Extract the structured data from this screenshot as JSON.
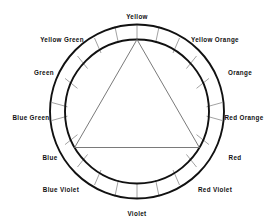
{
  "diagram": {
    "title_visible": false,
    "type": "color-wheel",
    "background_color": "#ffffff",
    "line_color": "#111111",
    "divider_color": "#8a8a8a",
    "triangle_color": "#7a7a7a",
    "geometry": {
      "center_x": 137,
      "center_y": 111.5,
      "outer_radius": 87,
      "inner_radius": 72,
      "segment_count": 12,
      "segment_angle_degrees": 30,
      "divider_offset_degrees": 15
    },
    "segments": [
      {
        "label": "Yellow",
        "angle_degrees": 0,
        "label_x": 137,
        "label_y": 17,
        "align": "center"
      },
      {
        "label": "Yellow Orange",
        "angle_degrees": 30,
        "label_x": 215,
        "label_y": 40,
        "align": "center"
      },
      {
        "label": "Orange",
        "angle_degrees": 60,
        "label_x": 240,
        "label_y": 73,
        "align": "center"
      },
      {
        "label": "Red Orange",
        "angle_degrees": 90,
        "label_x": 244,
        "label_y": 118,
        "align": "center"
      },
      {
        "label": "Red",
        "angle_degrees": 120,
        "label_x": 235,
        "label_y": 158,
        "align": "center"
      },
      {
        "label": "Red Violet",
        "angle_degrees": 150,
        "label_x": 215,
        "label_y": 190,
        "align": "center"
      },
      {
        "label": "Violet",
        "angle_degrees": 180,
        "label_x": 137,
        "label_y": 214,
        "align": "center"
      },
      {
        "label": "Blue Violet",
        "angle_degrees": 210,
        "label_x": 61,
        "label_y": 190,
        "align": "center"
      },
      {
        "label": "Blue",
        "angle_degrees": 240,
        "label_x": 50,
        "label_y": 158,
        "align": "center"
      },
      {
        "label": "Blue Green",
        "angle_degrees": 270,
        "label_x": 31,
        "label_y": 118,
        "align": "center"
      },
      {
        "label": "Green",
        "angle_degrees": 300,
        "label_x": 44,
        "label_y": 73,
        "align": "center"
      },
      {
        "label": "Yellow Green",
        "angle_degrees": 330,
        "label_x": 62,
        "label_y": 40,
        "align": "center"
      }
    ],
    "primary_triangle": {
      "vertices": [
        {
          "label": "Yellow",
          "angle_degrees": 0,
          "x": 137,
          "y": 39.5
        },
        {
          "label": "Red",
          "angle_degrees": 120,
          "x": 199.4,
          "y": 147.5
        },
        {
          "label": "Blue",
          "angle_degrees": 240,
          "x": 74.6,
          "y": 147.5
        }
      ]
    }
  }
}
